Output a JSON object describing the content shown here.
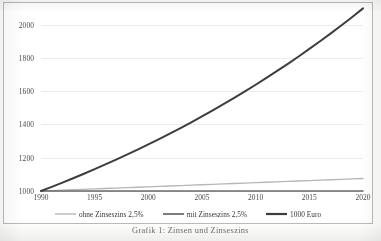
{
  "chart_data": {
    "type": "line",
    "title": "",
    "subtitle": "",
    "xlabel": "",
    "ylabel": "",
    "xlim": [
      1990,
      2020
    ],
    "ylim": [
      1000,
      2100
    ],
    "grid": true,
    "legend_position": "bottom",
    "x_ticks": [
      "1990",
      "1995",
      "2000",
      "2005",
      "2010",
      "2015",
      "2020"
    ],
    "y_ticks": [
      "1000",
      "1200",
      "1400",
      "1600",
      "1800",
      "2000"
    ],
    "x": [
      1990,
      1991,
      1992,
      1993,
      1994,
      1995,
      1996,
      1997,
      1998,
      1999,
      2000,
      2001,
      2002,
      2003,
      2004,
      2005,
      2006,
      2007,
      2008,
      2009,
      2010,
      2011,
      2012,
      2013,
      2014,
      2015,
      2016,
      2017,
      2018,
      2019,
      2020
    ],
    "series": [
      {
        "name": "ohne Zinseszins 2,5%",
        "color": "#b6b6b6",
        "width": 1.3,
        "values": [
          1000,
          1002.5,
          1005,
          1007.5,
          1010,
          1012.5,
          1015,
          1017.5,
          1020,
          1022.5,
          1025,
          1027.5,
          1030,
          1032.5,
          1035,
          1037.5,
          1040,
          1042.5,
          1045,
          1047.5,
          1050,
          1052.5,
          1055,
          1057.5,
          1060,
          1062.5,
          1065,
          1067.5,
          1070,
          1072.5,
          1075
        ]
      },
      {
        "name": "mit Zinseszins 2,5%",
        "color": "#6e6e6e",
        "width": 1.5,
        "values": [
          1000,
          1000,
          1000,
          1000,
          1000,
          1000,
          1000,
          1000,
          1000,
          1000,
          1000,
          1000,
          1000,
          1000,
          1000,
          1000,
          1000,
          1000,
          1000,
          1000,
          1000,
          1000,
          1000,
          1000,
          1000,
          1000,
          1000,
          1000,
          1000,
          1000,
          1000
        ]
      },
      {
        "name": "1000 Euro",
        "color": "#3d3d3d",
        "width": 2.0,
        "values": [
          1000,
          1025,
          1050.6,
          1076.9,
          1103.8,
          1131.4,
          1159.7,
          1188.7,
          1218.4,
          1248.9,
          1280.1,
          1312.1,
          1344.9,
          1378.5,
          1413.0,
          1448.3,
          1484.5,
          1521.6,
          1559.7,
          1598.7,
          1638.6,
          1679.6,
          1721.6,
          1764.6,
          1808.7,
          1854.0,
          1900.3,
          1947.8,
          1996.5,
          2046.4,
          2097.6
        ]
      }
    ]
  },
  "legend": {
    "items": [
      {
        "label": "ohne Zinseszins 2,5%"
      },
      {
        "label": "mit Zinseszins 2,5%"
      },
      {
        "label": "1000 Euro"
      }
    ]
  },
  "caption": {
    "text": "Grafik 1: Zinsen und Zinseszins"
  }
}
